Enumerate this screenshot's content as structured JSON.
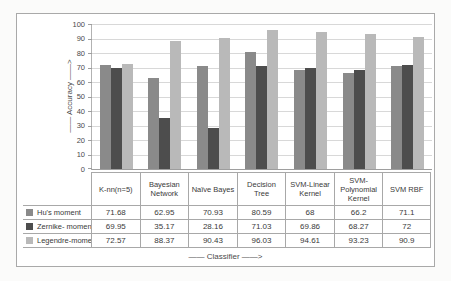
{
  "figure": {
    "y_axis_title": "—— Accuracy ——>",
    "x_axis_title": "—— Classifier ——>"
  },
  "chart_data": {
    "type": "bar",
    "title": "",
    "xlabel": "Classifier",
    "ylabel": "Accuracy",
    "ylim": [
      0,
      100
    ],
    "ytick_step": 10,
    "grid": true,
    "legend_position": "left-of-data-table",
    "categories": [
      "K-nn(n=5)",
      "Bayesian Network",
      "Naïve Bayes",
      "Decision Tree",
      "SVM-Linear Kernel",
      "SVM-Polynomial Kernel",
      "SVM RBF"
    ],
    "series": [
      {
        "name": "Hu's moment",
        "color": "#8a8a8a",
        "values": [
          71.68,
          62.95,
          70.93,
          80.59,
          68,
          66.2,
          71.1
        ]
      },
      {
        "name": "Zernike- moment",
        "color": "#4d4d4d",
        "values": [
          69.95,
          35.17,
          28.16,
          71.03,
          69.86,
          68.27,
          72
        ]
      },
      {
        "name": "Legendre-moment",
        "color": "#b9b9b9",
        "values": [
          72.57,
          88.37,
          90.43,
          96.03,
          94.61,
          93.23,
          90.9
        ]
      }
    ],
    "colors": {
      "gridline": "#d8d8d8",
      "axis": "#9e9e9e",
      "table_border": "#a8a8a8"
    }
  }
}
